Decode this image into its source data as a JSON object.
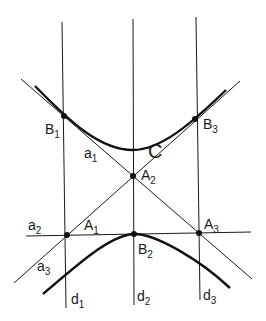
{
  "diagram": {
    "curve_label": "C",
    "points": {
      "B1": {
        "label": "B",
        "sub": "1"
      },
      "B2": {
        "label": "B",
        "sub": "2"
      },
      "B3": {
        "label": "B",
        "sub": "3"
      },
      "A1": {
        "label": "A",
        "sub": "1"
      },
      "A2": {
        "label": "A",
        "sub": "2"
      },
      "A3": {
        "label": "A",
        "sub": "3"
      }
    },
    "lines": {
      "a1": {
        "label": "a",
        "sub": "1"
      },
      "a2": {
        "label": "a",
        "sub": "2"
      },
      "a3": {
        "label": "a",
        "sub": "3"
      },
      "d1": {
        "label": "d",
        "sub": "1"
      },
      "d2": {
        "label": "d",
        "sub": "2"
      },
      "d3": {
        "label": "d",
        "sub": "3"
      }
    },
    "colors": {
      "stroke": "#1a1a1a",
      "background": "#ffffff"
    }
  }
}
